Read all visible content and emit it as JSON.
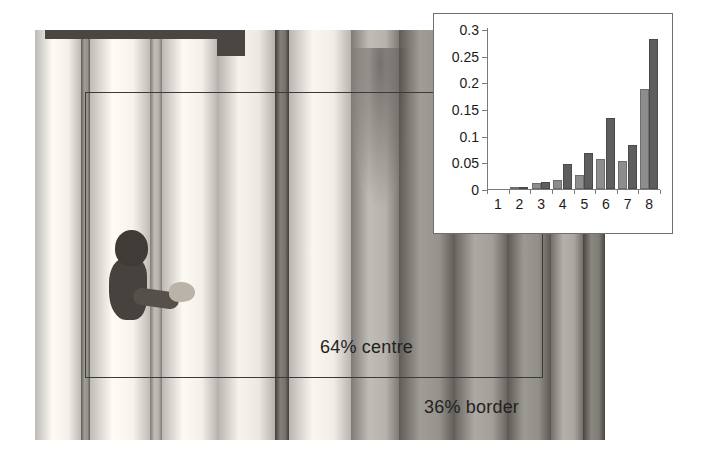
{
  "figure": {
    "annotations": {
      "centre_label": "64% centre",
      "border_label": "36% border"
    },
    "photo": {
      "subject": "child-behind-colonnade",
      "columns": 12
    }
  },
  "chart_data": {
    "type": "bar",
    "title": "",
    "xlabel": "",
    "ylabel": "",
    "categories": [
      "1",
      "2",
      "3",
      "4",
      "5",
      "6",
      "7",
      "8"
    ],
    "series": [
      {
        "name": "series-1",
        "color": "#8d8d8d",
        "values": [
          0.0,
          0.001,
          0.012,
          0.017,
          0.026,
          0.057,
          0.052,
          0.187
        ]
      },
      {
        "name": "series-2",
        "color": "#5e5e5e",
        "values": [
          0.0,
          0.002,
          0.013,
          0.046,
          0.067,
          0.134,
          0.082,
          0.282
        ]
      }
    ],
    "ylim": [
      0,
      0.3
    ],
    "yticks": [
      0,
      0.05,
      0.1,
      0.15,
      0.2,
      0.25,
      0.3
    ],
    "ytick_labels": [
      "0",
      "0.05",
      "0.1",
      "0.15",
      "0.2",
      "0.25",
      "0.3"
    ],
    "grid": false,
    "legend": "none"
  },
  "colors": {
    "rect_stroke": "#3a3a3a",
    "panel_border": "#6f6f6f",
    "text": "#25211e"
  }
}
